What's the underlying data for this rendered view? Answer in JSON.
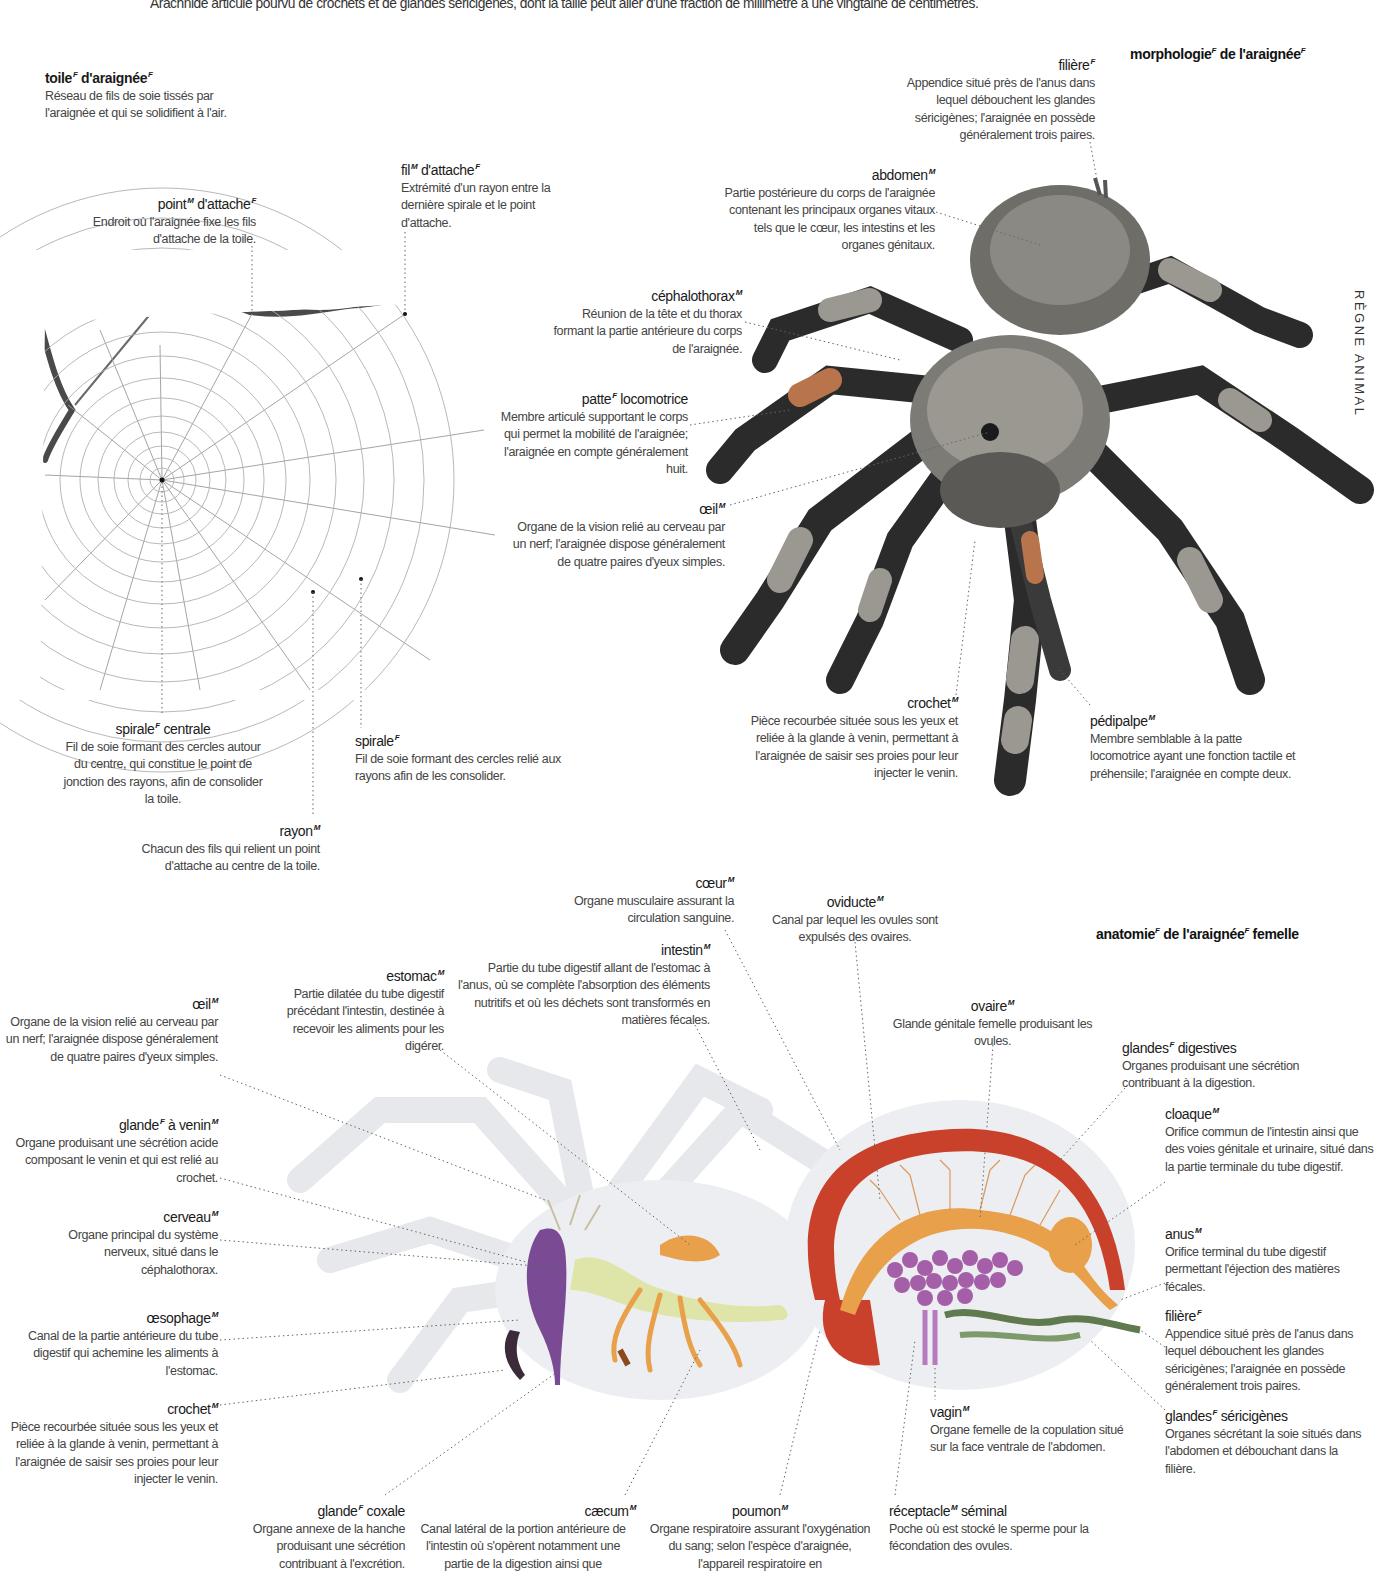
{
  "intro_text": "Arachnide articulé pourvu de crochets et de glandes séricigènes, dont la taille peut aller d'une fraction de millimètre à une vingtaine de centimètres.",
  "side_tab": "RÈGNE ANIMAL",
  "sections": {
    "morphology_title": {
      "term": "morphologie",
      "g1": "F",
      "rest": " de l'araignée",
      "g2": "F"
    },
    "anatomy_title": {
      "term": "anatomie",
      "g1": "F",
      "rest": " de l'araignée",
      "g2": "F",
      "tail": " femelle"
    }
  },
  "web": {
    "toile": {
      "term": "toile",
      "g": "F",
      "term2": " d'araignée",
      "g2": "F",
      "desc": "Réseau de fils de soie tissés par l'araignée et qui se solidifient à l'air."
    },
    "point_attache": {
      "term": "point",
      "g": "M",
      "term2": " d'attache",
      "g2": "F",
      "desc": "Endroit où l'araignée fixe les fils d'attache de la toile."
    },
    "fil_attache": {
      "term": "fil",
      "g": "M",
      "term2": " d'attache",
      "g2": "F",
      "desc": "Extrémité d'un rayon entre la dernière spirale et le point d'attache."
    },
    "spirale_centrale": {
      "term": "spirale",
      "g": "F",
      "term2": " centrale",
      "desc": "Fil de soie formant des cercles autour du centre, qui constitue le point de jonction des rayons, afin de consolider la toile."
    },
    "spirale": {
      "term": "spirale",
      "g": "F",
      "desc": "Fil de soie formant des cercles relié aux rayons afin de les consolider."
    },
    "rayon": {
      "term": "rayon",
      "g": "M",
      "desc": "Chacun des fils qui relient un point d'attache au centre de la toile."
    }
  },
  "morphology": {
    "filiere": {
      "term": "filière",
      "g": "F",
      "desc": "Appendice situé près de l'anus dans lequel débouchent les glandes séricigènes; l'araignée en possède généralement trois paires."
    },
    "abdomen": {
      "term": "abdomen",
      "g": "M",
      "desc": "Partie postérieure du corps de l'araignée contenant les principaux organes vitaux tels que le cœur, les intestins et les organes génitaux."
    },
    "cephalothorax": {
      "term": "céphalothorax",
      "g": "M",
      "desc": "Réunion de la tête et du thorax formant la partie antérieure du corps de l'araignée."
    },
    "patte": {
      "term": "patte",
      "g": "F",
      "term2": " locomotrice",
      "desc": "Membre articulé supportant le corps qui permet la mobilité de l'araignée; l'araignée en compte généralement huit."
    },
    "oeil": {
      "term": "œil",
      "g": "M",
      "desc": "Organe de la vision relié au cerveau par un nerf; l'araignée dispose généralement de quatre paires d'yeux simples."
    },
    "crochet": {
      "term": "crochet",
      "g": "M",
      "desc": "Pièce recourbée située sous les yeux et reliée à la glande à venin, permettant à l'araignée de saisir ses proies pour leur injecter le venin."
    },
    "pedipalpe": {
      "term": "pédipalpe",
      "g": "M",
      "desc": "Membre semblable à la patte locomotrice ayant une fonction tactile et préhensile; l'araignée en compte deux."
    }
  },
  "anatomy": {
    "coeur": {
      "term": "cœur",
      "g": "M",
      "desc": "Organe musculaire assurant la circulation sanguine."
    },
    "oviducte": {
      "term": "oviducte",
      "g": "M",
      "desc": "Canal par lequel les ovules sont expulsés des ovaires."
    },
    "intestin": {
      "term": "intestin",
      "g": "M",
      "desc": "Partie du tube digestif allant de l'estomac à l'anus, où se complète l'absorption des éléments nutritifs et où les déchets sont transformés en matières fécales."
    },
    "estomac": {
      "term": "estomac",
      "g": "M",
      "desc": "Partie dilatée du tube digestif précédant l'intestin, destinée à recevoir les aliments pour les digérer."
    },
    "ovaire": {
      "term": "ovaire",
      "g": "M",
      "desc": "Glande génitale femelle produisant les ovules."
    },
    "oeil": {
      "term": "œil",
      "g": "M",
      "desc": "Organe de la vision relié au cerveau par un nerf; l'araignée dispose généralement de quatre paires d'yeux simples."
    },
    "glandes_digestives": {
      "term": "glandes",
      "g": "F",
      "term2": " digestives",
      "desc": "Organes produisant une sécrétion contribuant à la digestion."
    },
    "glande_venin": {
      "term": "glande",
      "g": "F",
      "term2": " à venin",
      "g2": "M",
      "desc": "Organe produisant une sécrétion acide composant le venin et qui est relié au crochet."
    },
    "cloaque": {
      "term": "cloaque",
      "g": "M",
      "desc": "Orifice commun de l'intestin ainsi que des voies génitale et urinaire, situé dans la partie terminale du tube digestif."
    },
    "cerveau": {
      "term": "cerveau",
      "g": "M",
      "desc": "Organe principal du système nerveux, situé dans le céphalothorax."
    },
    "anus": {
      "term": "anus",
      "g": "M",
      "desc": "Orifice terminal du tube digestif permettant l'éjection des matières fécales."
    },
    "oesophage": {
      "term": "œsophage",
      "g": "M",
      "desc": "Canal de la partie antérieure du tube digestif qui achemine les aliments à l'estomac."
    },
    "filiere": {
      "term": "filière",
      "g": "F",
      "desc": "Appendice situé près de l'anus dans lequel débouchent les glandes séricigènes; l'araignée en possède généralement trois paires."
    },
    "crochet": {
      "term": "crochet",
      "g": "M",
      "desc": "Pièce recourbée située sous les yeux et reliée à la glande à venin, permettant à l'araignée de saisir ses proies pour leur injecter le venin."
    },
    "glandes_sericigenes": {
      "term": "glandes",
      "g": "F",
      "term2": " séricigènes",
      "desc": "Organes sécrétant la soie situés dans l'abdomen et débouchant dans la filière."
    },
    "vagin": {
      "term": "vagin",
      "g": "M",
      "desc": "Organe femelle de la copulation situé sur la face ventrale de l'abdomen."
    },
    "glande_coxale": {
      "term": "glande",
      "g": "F",
      "term2": " coxale",
      "desc": "Organe annexe de la hanche produisant une sécrétion contribuant à l'excrétion."
    },
    "caecum": {
      "term": "cæcum",
      "g": "M",
      "desc": "Canal latéral de la portion antérieure de l'intestin où s'opèrent notamment une partie de la digestion ainsi que"
    },
    "poumon": {
      "term": "poumon",
      "g": "M",
      "desc": "Organe respiratoire assurant l'oxygénation du sang; selon l'espèce d'araignée, l'appareil respiratoire en"
    },
    "receptacle": {
      "term": "réceptacle",
      "g": "M",
      "term2": " séminal",
      "desc": "Poche où est stocké le sperme pour la fécondation des ovules."
    }
  },
  "colors": {
    "heart": "#c9412b",
    "intestine": "#e8a04a",
    "ovary": "#a45fa8",
    "brain": "#7a4b94",
    "esophagus": "#dfe5a8",
    "silk_gland": "#5f7a4e",
    "body_ghost": "#e9ebee",
    "tarantula_dark": "#2b2b2b",
    "tarantula_light": "#9a9890",
    "tarantula_orange": "#b8744a"
  }
}
